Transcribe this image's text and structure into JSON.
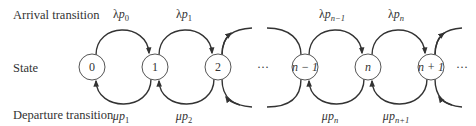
{
  "row_labels": {
    "arrival": "Arrival transition",
    "state": "State",
    "departure": "Departure transition"
  },
  "states": [
    {
      "label": "0",
      "cx": 92
    },
    {
      "label": "1",
      "cx": 155
    },
    {
      "label": "2",
      "cx": 218
    },
    {
      "label": "n − 1",
      "cx": 305
    },
    {
      "label": "n",
      "cx": 368
    },
    {
      "label": "n + 1",
      "cx": 431
    }
  ],
  "ellipses": [
    {
      "label": "···",
      "x": 263
    },
    {
      "label": "···",
      "x": 460
    }
  ],
  "arrival_rates": [
    {
      "sym": "λ",
      "var": "p",
      "sub": "0",
      "x": 121
    },
    {
      "sym": "λ",
      "var": "p",
      "sub": "1",
      "x": 184
    },
    {
      "sym": "λ",
      "var": "p",
      "sub": "n−1",
      "x": 330
    },
    {
      "sym": "λ",
      "var": "p",
      "sub": "n",
      "x": 396
    }
  ],
  "departure_rates": [
    {
      "sym": "μ",
      "var": "p",
      "sub": "1",
      "x": 121
    },
    {
      "sym": "μ",
      "var": "p",
      "sub": "2",
      "x": 184
    },
    {
      "sym": "μ",
      "var": "p",
      "sub": "n",
      "x": 330
    },
    {
      "sym": "μ",
      "var": "p",
      "sub": "n+1",
      "x": 396
    }
  ],
  "colors": {
    "stroke": "#333333",
    "text": "#333333",
    "background": "#ffffff"
  }
}
